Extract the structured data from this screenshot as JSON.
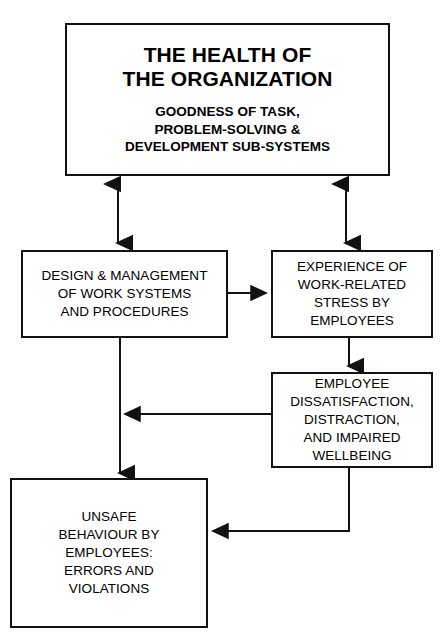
{
  "diagram": {
    "title": "The Health of the Organization",
    "background_color": "#ffffff",
    "line_color": "#111111",
    "text_color": "#000000",
    "nodes": {
      "health": {
        "headline": [
          "THE HEALTH OF",
          "THE ORGANIZATION"
        ],
        "subhead": [
          "GOODNESS OF TASK,",
          "PROBLEM-SOLVING &",
          "DEVELOPMENT SUB-SYSTEMS"
        ]
      },
      "design": {
        "lines": [
          "DESIGN & MANAGEMENT",
          "OF WORK SYSTEMS",
          "AND PROCEDURES"
        ]
      },
      "stress": {
        "lines": [
          "EXPERIENCE OF",
          "WORK-RELATED",
          "STRESS BY",
          "EMPLOYEES"
        ]
      },
      "dissatisfaction": {
        "lines": [
          "EMPLOYEE",
          "DISSATISFACTION,",
          "DISTRACTION,",
          "AND IMPAIRED",
          "WELLBEING"
        ]
      },
      "unsafe": {
        "lines": [
          "UNSAFE",
          "BEHAVIOUR BY",
          "EMPLOYEES:",
          "ERRORS AND",
          "VIOLATIONS"
        ]
      }
    },
    "connectors": [
      {
        "name": "health-design-bidirectional",
        "from": "health",
        "to": "design",
        "style": "double-headed-vertical"
      },
      {
        "name": "health-stress-bidirectional",
        "from": "health",
        "to": "stress",
        "style": "double-headed-vertical"
      },
      {
        "name": "design-stress",
        "from": "design",
        "to": "stress",
        "style": "single-arrow-right"
      },
      {
        "name": "stress-dissatisfaction",
        "from": "stress",
        "to": "dissatisfaction",
        "style": "single-arrow-down"
      },
      {
        "name": "dissatisfaction-design-feedback",
        "from": "dissatisfaction",
        "to": "design-unsafe-link",
        "style": "single-arrow-left"
      },
      {
        "name": "design-unsafe",
        "from": "design",
        "to": "unsafe",
        "style": "single-arrow-down"
      },
      {
        "name": "dissatisfaction-unsafe",
        "from": "dissatisfaction",
        "to": "unsafe",
        "style": "elbow-arrow-left"
      }
    ]
  }
}
